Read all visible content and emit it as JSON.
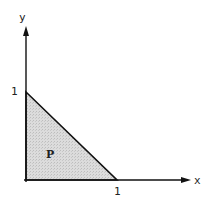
{
  "diagram": {
    "axes": {
      "x_label": "x",
      "y_label": "y",
      "x_tick": "1",
      "y_tick": "1"
    },
    "region": {
      "label": "P",
      "fill": "#d9d9d9",
      "vertices": [
        [
          0,
          0
        ],
        [
          1,
          0
        ],
        [
          0,
          1
        ]
      ]
    },
    "colors": {
      "line": "#111111",
      "fill": "#d9d9d9"
    }
  }
}
